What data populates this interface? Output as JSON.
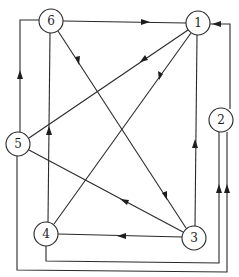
{
  "diagram": {
    "type": "directed-graph",
    "width": 239,
    "height": 277,
    "colors": {
      "line": "#2a2a2a",
      "node_fill": "#ffffff",
      "text": "#1e1e1e"
    },
    "nodes": [
      {
        "id": "1",
        "label": "1",
        "x": 198,
        "y": 23
      },
      {
        "id": "2",
        "label": "2",
        "x": 221,
        "y": 120
      },
      {
        "id": "3",
        "label": "3",
        "x": 194,
        "y": 238
      },
      {
        "id": "4",
        "label": "4",
        "x": 46,
        "y": 234
      },
      {
        "id": "5",
        "label": "5",
        "x": 18,
        "y": 144
      },
      {
        "id": "6",
        "label": "6",
        "x": 51,
        "y": 21
      }
    ],
    "edges": [
      {
        "from": "6",
        "to": "1",
        "route": "straight"
      },
      {
        "from": "1",
        "to": "5",
        "route": "straight"
      },
      {
        "from": "1",
        "to": "4",
        "route": "straight"
      },
      {
        "from": "6",
        "to": "3",
        "route": "straight"
      },
      {
        "from": "3",
        "to": "5",
        "route": "straight"
      },
      {
        "from": "3",
        "to": "4",
        "route": "straight"
      },
      {
        "from": "3",
        "to": "1",
        "route": "vertical"
      },
      {
        "from": "4",
        "to": "6",
        "route": "vertical"
      },
      {
        "from": "5",
        "to": "6",
        "route": "orthogonal-left-top"
      },
      {
        "from": "2",
        "to": "1",
        "route": "orthogonal-up-left"
      },
      {
        "from": "4",
        "to": "2",
        "route": "orthogonal-bottom-right-up"
      },
      {
        "from": "5",
        "to": "2",
        "route": "orthogonal-bottom-right-up"
      }
    ]
  }
}
